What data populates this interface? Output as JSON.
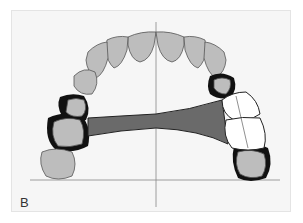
{
  "figure": {
    "panel_label": "B",
    "colors": {
      "background": "#f6f6f6",
      "tooth_fill": "#b9b9b9",
      "tooth_outline": "#555555",
      "connector": "#6a6a6a",
      "clasp": "#111111",
      "replacement_teeth": "#ffffff",
      "axis_lines": "#888888"
    }
  }
}
